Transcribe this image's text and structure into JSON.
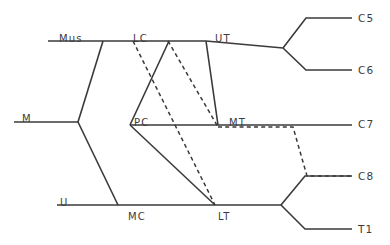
{
  "diagram": {
    "type": "phylogenetic-tree",
    "title": "",
    "colors": {
      "stroke": "#3a3a3a",
      "text": "#3c3c3c",
      "background": "#ffffff"
    },
    "internal_nodes": [
      {
        "id": "mus",
        "label": "Mus",
        "x": 59,
        "y": 34
      },
      {
        "id": "lc",
        "label": "LC",
        "x": 133,
        "y": 34
      },
      {
        "id": "ut",
        "label": "UT",
        "x": 215,
        "y": 34
      },
      {
        "id": "m",
        "label": "M",
        "x": 22,
        "y": 114
      },
      {
        "id": "pc",
        "label": "PC",
        "x": 134,
        "y": 118
      },
      {
        "id": "mt",
        "label": "MT",
        "x": 229,
        "y": 118
      },
      {
        "id": "u",
        "label": "U",
        "x": 60,
        "y": 198
      },
      {
        "id": "mc",
        "label": "MC",
        "x": 128,
        "y": 212
      },
      {
        "id": "lt",
        "label": "LT",
        "x": 218,
        "y": 212
      }
    ],
    "leaf_nodes": [
      {
        "id": "c5",
        "label": "C5",
        "x": 358,
        "y": 13
      },
      {
        "id": "c6",
        "label": "C6",
        "x": 358,
        "y": 65
      },
      {
        "id": "c7",
        "label": "C7",
        "x": 358,
        "y": 119
      },
      {
        "id": "c8",
        "label": "C8",
        "x": 358,
        "y": 171
      },
      {
        "id": "t1",
        "label": "T1",
        "x": 358,
        "y": 224
      }
    ],
    "edges_solid": [
      {
        "name": "mus-backbone",
        "points": "48,41 206,41"
      },
      {
        "name": "ut-stem",
        "points": "206,41 283,48"
      },
      {
        "name": "ut-fork-upper",
        "points": "283,48 306,18 352,18"
      },
      {
        "name": "ut-fork-lower",
        "points": "283,48 306,70 352,70"
      },
      {
        "name": "m-backbone",
        "points": "14,122 78,122"
      },
      {
        "name": "m-fork-up-to-mus",
        "points": "78,122 103,41"
      },
      {
        "name": "m-fork-down-to-u",
        "points": "78,122 118,205"
      },
      {
        "name": "pc-backbone",
        "points": "130,125 352,125"
      },
      {
        "name": "lc-to-pc-descend",
        "points": "169,41 130,125"
      },
      {
        "name": "pc-to-lt-descend",
        "points": "130,125 215,205"
      },
      {
        "name": "ut-to-mt-descend",
        "points": "206,41 218,125"
      },
      {
        "name": "u-backbone",
        "points": "57,205 281,205"
      },
      {
        "name": "lt-fork-upper",
        "points": "281,205 305,176 352,176"
      },
      {
        "name": "lt-fork-lower",
        "points": "281,205 305,229 352,229"
      }
    ],
    "edges_dashed": [
      {
        "name": "lc-to-lt-dashed",
        "points": "133,41 215,205"
      },
      {
        "name": "lc-to-mt-dashed",
        "points": "168,41 218,127"
      },
      {
        "name": "mt-to-c8-dashed",
        "points": "218,127 293,127 307,176 352,176"
      }
    ]
  }
}
